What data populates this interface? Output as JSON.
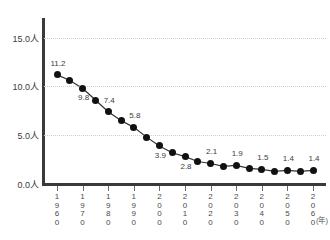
{
  "title_strip": "",
  "axis": {
    "y_unit_suffix": "人",
    "y_ticks": [
      "15.0人",
      "10.0人",
      "5.0人",
      "0.0人"
    ],
    "x_unit": "(年)"
  },
  "chart_data": {
    "type": "line",
    "title": "",
    "xlabel": "(年)",
    "ylabel": "人",
    "ylim": [
      0.0,
      17.0
    ],
    "xlim": [
      1960,
      2060
    ],
    "grid": true,
    "legend": "none",
    "y_tick_values": [
      15.0,
      10.0,
      5.0,
      0.0
    ],
    "y_tick_labels": [
      "15.0人",
      "10.0人",
      "5.0人",
      "0.0人"
    ],
    "x_tick_labels": [
      "1960",
      "1970",
      "1980",
      "1990",
      "2000",
      "2010",
      "2020",
      "2030",
      "2040",
      "2050",
      "2060"
    ],
    "x": [
      1960,
      1965,
      1970,
      1975,
      1980,
      1985,
      1990,
      1995,
      2000,
      2005,
      2010,
      2015,
      2020,
      2025,
      2030,
      2035,
      2040,
      2045,
      2050,
      2055,
      2060
    ],
    "values": [
      11.2,
      10.6,
      9.8,
      8.6,
      7.4,
      6.5,
      5.8,
      4.8,
      3.9,
      3.2,
      2.8,
      2.3,
      2.1,
      1.8,
      1.9,
      1.6,
      1.5,
      1.3,
      1.4,
      1.3,
      1.4
    ],
    "point_labels": [
      {
        "x": 1960,
        "value": 11.2,
        "text": "11.2",
        "pos": "above"
      },
      {
        "x": 1970,
        "value": 9.8,
        "text": "9.8",
        "pos": "below"
      },
      {
        "x": 1980,
        "value": 7.4,
        "text": "7.4",
        "pos": "above"
      },
      {
        "x": 1990,
        "value": 5.8,
        "text": "5.8",
        "pos": "above"
      },
      {
        "x": 2000,
        "value": 3.9,
        "text": "3.9",
        "pos": "below"
      },
      {
        "x": 2010,
        "value": 2.8,
        "text": "2.8",
        "pos": "below"
      },
      {
        "x": 2020,
        "value": 2.1,
        "text": "2.1",
        "pos": "above"
      },
      {
        "x": 2030,
        "value": 1.9,
        "text": "1.9",
        "pos": "above"
      },
      {
        "x": 2040,
        "value": 1.5,
        "text": "1.5",
        "pos": "above"
      },
      {
        "x": 2050,
        "value": 1.4,
        "text": "1.4",
        "pos": "above"
      },
      {
        "x": 2060,
        "value": 1.4,
        "text": "1.4",
        "pos": "above"
      }
    ],
    "marker": "circle-filled",
    "colors": {
      "line": "#333333",
      "marker": "#111111",
      "axis": "#3a3a3a",
      "grid": "#cfcfcf",
      "text": "#3c3c3c",
      "background": "#ffffff"
    }
  }
}
